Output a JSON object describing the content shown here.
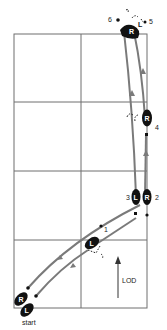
{
  "diagram": {
    "labels": {
      "start": "start",
      "lod": "LOD"
    },
    "steps": [
      {
        "num": "1",
        "foot": "L"
      },
      {
        "num": "2",
        "foot": "R"
      },
      {
        "num": "3",
        "foot": "L"
      },
      {
        "num": "4",
        "foot": "R"
      },
      {
        "num": "5",
        "foot": "L"
      },
      {
        "num": "6",
        "foot": "R"
      }
    ],
    "start_feet": [
      {
        "foot": "R"
      },
      {
        "foot": "L"
      }
    ],
    "colors": {
      "foot": "#111111",
      "path": "#7a7a7a",
      "grid": "#6f6f6f"
    }
  }
}
